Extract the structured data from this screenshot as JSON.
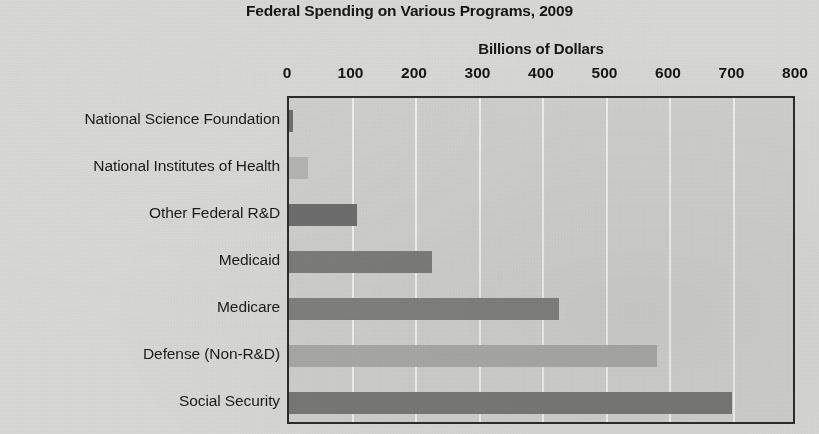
{
  "chart_data": {
    "type": "bar",
    "orientation": "horizontal",
    "title": "Federal Spending on Various Programs, 2009",
    "xlabel": "Billions of Dollars",
    "ylabel": "",
    "xlim": [
      0,
      800
    ],
    "xticks": [
      0,
      100,
      200,
      300,
      400,
      500,
      600,
      700,
      800
    ],
    "xtick_labels": [
      "0",
      "100",
      "200",
      "300",
      "400",
      "500",
      "600",
      "700",
      "800"
    ],
    "grid": "vertical-only",
    "legend": "none",
    "categories": [
      "National Science Foundation",
      "National Institutes of Health",
      "Other Federal R&D",
      "Medicaid",
      "Medicare",
      "Defense (Non-R&D)",
      "Social Security"
    ],
    "values": [
      6,
      30,
      107,
      225,
      425,
      580,
      698
    ],
    "bar_colors": [
      "#6f6f6f",
      "#b4b4b2",
      "#6e6e6e",
      "#7c7c7a",
      "#818180",
      "#a9a9a7",
      "#787876"
    ]
  },
  "style": {
    "page_background": "#d8d8d6",
    "plot_background": "#cfcfcd",
    "plot_border": "#2c2c2c",
    "gridline_color": "#f2f2f0",
    "text_color": "#1b1b1b"
  }
}
